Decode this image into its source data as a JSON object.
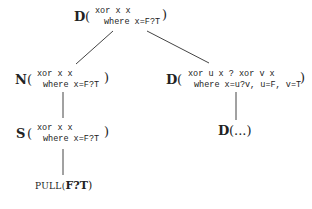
{
  "tree": {
    "root": {
      "label": "D",
      "open": "(",
      "close": ")",
      "line1": "xor x x",
      "line2": "where x=F?T"
    },
    "left": {
      "label": "N",
      "open": "(",
      "close": ")",
      "line1": "xor x x",
      "line2": "where x=F?T"
    },
    "left_child": {
      "label": "S",
      "open": "(",
      "close": ")",
      "line1": "xor x x",
      "line2": "where x=F?T"
    },
    "left_leaf": {
      "prefix": "PULL(",
      "value": "F?T",
      "suffix": ")"
    },
    "right": {
      "label": "D",
      "open": "(",
      "close": ")",
      "line1": "xor u x ? xor v x",
      "line2": "where x=u?v, u=F, v=T"
    },
    "right_child": {
      "label": "D",
      "text": "(...)"
    }
  }
}
